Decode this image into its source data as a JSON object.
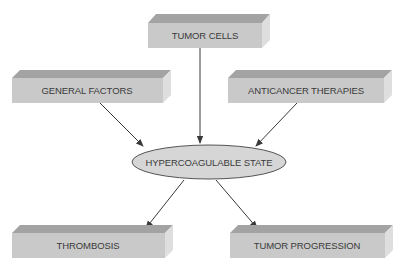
{
  "diagram": {
    "colors": {
      "box_front": "#c8c8c8",
      "box_top": "#9e9e9e",
      "box_side": "#dcdcdc",
      "ellipse_fill": "#d4d4d4",
      "ellipse_stroke": "#555555",
      "arrow": "#3a3a3a",
      "text": "#3a3a3a"
    },
    "nodes": {
      "tumor_cells": {
        "label": "TUMOR CELLS",
        "shape": "3d-box"
      },
      "general_factors": {
        "label": "GENERAL FACTORS",
        "shape": "3d-box"
      },
      "anticancer_therapies": {
        "label": "ANTICANCER THERAPIES",
        "shape": "3d-box"
      },
      "hypercoagulable_state": {
        "label": "HYPERCOAGULABLE STATE",
        "shape": "ellipse"
      },
      "thrombosis": {
        "label": "THROMBOSIS",
        "shape": "3d-box"
      },
      "tumor_progression": {
        "label": "TUMOR PROGRESSION",
        "shape": "3d-box"
      }
    },
    "edges": [
      {
        "from": "TUMOR CELLS",
        "to": "HYPERCOAGULABLE STATE"
      },
      {
        "from": "GENERAL FACTORS",
        "to": "HYPERCOAGULABLE STATE"
      },
      {
        "from": "ANTICANCER THERAPIES",
        "to": "HYPERCOAGULABLE STATE"
      },
      {
        "from": "HYPERCOAGULABLE STATE",
        "to": "THROMBOSIS"
      },
      {
        "from": "HYPERCOAGULABLE STATE",
        "to": "TUMOR PROGRESSION"
      }
    ]
  }
}
